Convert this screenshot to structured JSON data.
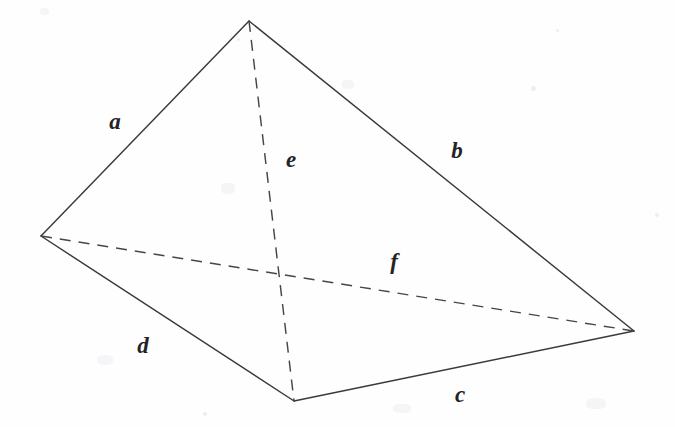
{
  "figure": {
    "background_color": "#fefefe",
    "line_color": "#3a3a3c",
    "dashed_line_color": "#46464a",
    "label_color": "#232326",
    "canvas": {
      "width": 675,
      "height": 427
    },
    "vertices": [
      {
        "name": "apex",
        "x": 249,
        "y": 21
      },
      {
        "name": "left",
        "x": 41,
        "y": 236
      },
      {
        "name": "bottom",
        "x": 294,
        "y": 401
      },
      {
        "name": "right",
        "x": 634,
        "y": 331
      }
    ],
    "edges": [
      {
        "id": "a",
        "label": "a",
        "style": "solid",
        "from": "apex",
        "to": "left",
        "label_x": 115,
        "label_y": 121
      },
      {
        "id": "b",
        "label": "b",
        "style": "solid",
        "from": "apex",
        "to": "right",
        "label_x": 457,
        "label_y": 150
      },
      {
        "id": "c",
        "label": "c",
        "style": "solid",
        "from": "bottom",
        "to": "right",
        "label_x": 460,
        "label_y": 394
      },
      {
        "id": "d",
        "label": "d",
        "style": "solid",
        "from": "left",
        "to": "bottom",
        "label_x": 143,
        "label_y": 345
      },
      {
        "id": "e",
        "label": "e",
        "style": "dashed",
        "from": "apex",
        "to": "bottom",
        "label_x": 291,
        "label_y": 159
      },
      {
        "id": "f",
        "label": "f",
        "style": "dashed",
        "from": "left",
        "to": "right",
        "label_x": 394,
        "label_y": 261
      }
    ]
  }
}
